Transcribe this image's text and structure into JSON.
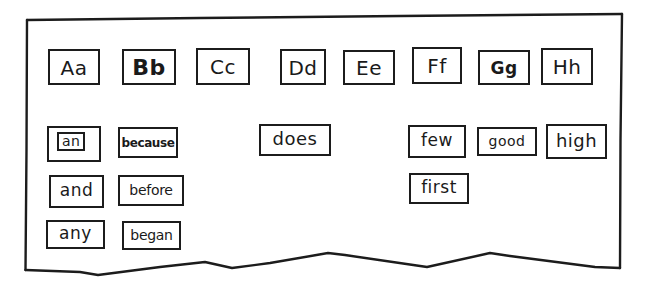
{
  "board": {
    "style": "hand-drawn word wall",
    "stroke_color": "#1c1c1c",
    "background": "#ffffff"
  },
  "letter_headers": [
    {
      "label": "Aa",
      "x": 48,
      "y": 49,
      "w": 52,
      "h": 36
    },
    {
      "label": "Bb",
      "x": 122,
      "y": 49,
      "w": 54,
      "h": 36
    },
    {
      "label": "Cc",
      "x": 196,
      "y": 48,
      "w": 54,
      "h": 37
    },
    {
      "label": "Dd",
      "x": 280,
      "y": 49,
      "w": 46,
      "h": 36
    },
    {
      "label": "Ee",
      "x": 343,
      "y": 50,
      "w": 52,
      "h": 35
    },
    {
      "label": "Ff",
      "x": 412,
      "y": 47,
      "w": 50,
      "h": 37
    },
    {
      "label": "Gg",
      "x": 478,
      "y": 50,
      "w": 52,
      "h": 35
    },
    {
      "label": "Hh",
      "x": 541,
      "y": 48,
      "w": 52,
      "h": 37
    }
  ],
  "word_cards": [
    {
      "label": "an",
      "column": "Aa",
      "x": 47,
      "y": 126,
      "w": 54,
      "h": 36,
      "variant": "boxed"
    },
    {
      "label": "because",
      "column": "Bb",
      "x": 118,
      "y": 127,
      "w": 60,
      "h": 31,
      "variant": "small"
    },
    {
      "label": "does",
      "column": "Dd",
      "x": 259,
      "y": 124,
      "w": 72,
      "h": 32,
      "variant": "normal"
    },
    {
      "label": "few",
      "column": "Ff",
      "x": 408,
      "y": 125,
      "w": 58,
      "h": 33,
      "variant": "normal"
    },
    {
      "label": "good",
      "column": "Gg",
      "x": 477,
      "y": 127,
      "w": 60,
      "h": 29,
      "variant": "small"
    },
    {
      "label": "high",
      "column": "Hh",
      "x": 546,
      "y": 124,
      "w": 61,
      "h": 35,
      "variant": "normal"
    },
    {
      "label": "and",
      "column": "Aa",
      "x": 49,
      "y": 175,
      "w": 55,
      "h": 33,
      "variant": "normal"
    },
    {
      "label": "before",
      "column": "Bb",
      "x": 118,
      "y": 175,
      "w": 66,
      "h": 31,
      "variant": "medium"
    },
    {
      "label": "first",
      "column": "Ff",
      "x": 409,
      "y": 173,
      "w": 60,
      "h": 31,
      "variant": "normal"
    },
    {
      "label": "any",
      "column": "Aa",
      "x": 46,
      "y": 220,
      "w": 59,
      "h": 29,
      "variant": "normal"
    },
    {
      "label": "began",
      "column": "Bb",
      "x": 122,
      "y": 221,
      "w": 59,
      "h": 29,
      "variant": "medium"
    }
  ]
}
